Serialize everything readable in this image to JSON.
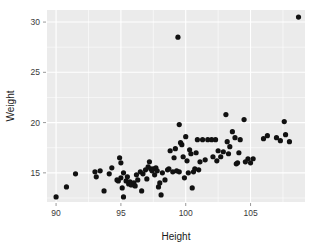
{
  "chart_data": {
    "type": "scatter",
    "title": "",
    "xlabel": "Height",
    "ylabel": "Weight",
    "xlim": [
      89.3,
      109.2
    ],
    "ylim": [
      12.1,
      31.2
    ],
    "xticks": [
      90,
      95,
      100,
      105
    ],
    "yticks": [
      15,
      20,
      25,
      30
    ],
    "xtick_labels": [
      "90",
      "95",
      "100",
      "105"
    ],
    "ytick_labels": [
      "15",
      "20",
      "25",
      "30"
    ],
    "x_minor_ticks": [
      92.5,
      97.5,
      102.5,
      107.5
    ],
    "y_minor_ticks": [
      12.5,
      17.5,
      22.5,
      27.5
    ],
    "grid": true,
    "legend": "none",
    "panel_color": "#ebebeb",
    "grid_color": "#ffffff",
    "point_color": "#111111",
    "point_size": 2.6,
    "points": [
      [
        90.0,
        12.6
      ],
      [
        90.8,
        13.6
      ],
      [
        91.5,
        14.9
      ],
      [
        93.0,
        15.1
      ],
      [
        93.1,
        14.6
      ],
      [
        93.4,
        15.2
      ],
      [
        93.7,
        13.2
      ],
      [
        94.1,
        14.9
      ],
      [
        94.3,
        15.5
      ],
      [
        94.7,
        14.3
      ],
      [
        94.8,
        14.2
      ],
      [
        94.9,
        16.5
      ],
      [
        95.0,
        16.0
      ],
      [
        95.0,
        14.5
      ],
      [
        95.1,
        13.5
      ],
      [
        95.2,
        15.0
      ],
      [
        95.2,
        12.6
      ],
      [
        95.4,
        14.2
      ],
      [
        95.5,
        14.6
      ],
      [
        95.6,
        13.9
      ],
      [
        95.7,
        14.1
      ],
      [
        95.8,
        13.8
      ],
      [
        96.0,
        14.0
      ],
      [
        96.1,
        13.7
      ],
      [
        96.2,
        14.8
      ],
      [
        96.3,
        14.3
      ],
      [
        96.5,
        15.1
      ],
      [
        96.6,
        13.2
      ],
      [
        96.7,
        14.9
      ],
      [
        96.9,
        15.3
      ],
      [
        97.0,
        14.4
      ],
      [
        97.1,
        15.6
      ],
      [
        97.2,
        16.1
      ],
      [
        97.3,
        15.4
      ],
      [
        97.4,
        15.2
      ],
      [
        97.5,
        15.4
      ],
      [
        97.6,
        14.8
      ],
      [
        97.7,
        15.5
      ],
      [
        97.8,
        15.2
      ],
      [
        97.9,
        13.6
      ],
      [
        98.0,
        14.0
      ],
      [
        98.1,
        12.8
      ],
      [
        98.2,
        15.0
      ],
      [
        98.4,
        14.3
      ],
      [
        98.6,
        15.3
      ],
      [
        98.7,
        15.4
      ],
      [
        98.8,
        17.2
      ],
      [
        99.0,
        15.1
      ],
      [
        99.1,
        16.5
      ],
      [
        99.2,
        17.4
      ],
      [
        99.3,
        15.2
      ],
      [
        99.4,
        28.5
      ],
      [
        99.5,
        19.8
      ],
      [
        99.5,
        15.1
      ],
      [
        99.6,
        18.0
      ],
      [
        99.7,
        17.8
      ],
      [
        99.8,
        16.6
      ],
      [
        99.9,
        14.5
      ],
      [
        100.0,
        18.6
      ],
      [
        100.1,
        16.2
      ],
      [
        100.2,
        15.0
      ],
      [
        100.3,
        17.3
      ],
      [
        100.4,
        16.9
      ],
      [
        100.5,
        13.5
      ],
      [
        100.6,
        15.1
      ],
      [
        100.7,
        15.4
      ],
      [
        100.8,
        17.0
      ],
      [
        100.9,
        18.3
      ],
      [
        101.0,
        15.3
      ],
      [
        101.1,
        16.1
      ],
      [
        101.3,
        18.3
      ],
      [
        101.5,
        16.3
      ],
      [
        101.7,
        18.3
      ],
      [
        102.0,
        18.3
      ],
      [
        102.1,
        16.6
      ],
      [
        102.3,
        18.3
      ],
      [
        102.4,
        16.2
      ],
      [
        102.5,
        17.2
      ],
      [
        102.7,
        16.6
      ],
      [
        102.9,
        17.1
      ],
      [
        103.1,
        20.8
      ],
      [
        103.2,
        18.1
      ],
      [
        103.3,
        16.9
      ],
      [
        103.4,
        17.6
      ],
      [
        103.6,
        19.1
      ],
      [
        103.8,
        18.5
      ],
      [
        103.9,
        15.9
      ],
      [
        104.0,
        16.0
      ],
      [
        104.1,
        17.0
      ],
      [
        104.2,
        18.3
      ],
      [
        104.5,
        20.3
      ],
      [
        104.6,
        16.1
      ],
      [
        104.8,
        16.4
      ],
      [
        105.0,
        16.0
      ],
      [
        105.2,
        16.4
      ],
      [
        106.0,
        18.4
      ],
      [
        106.3,
        18.7
      ],
      [
        107.0,
        18.5
      ],
      [
        107.3,
        18.2
      ],
      [
        107.6,
        20.1
      ],
      [
        107.7,
        18.8
      ],
      [
        108.0,
        18.1
      ],
      [
        108.7,
        30.5
      ]
    ]
  }
}
